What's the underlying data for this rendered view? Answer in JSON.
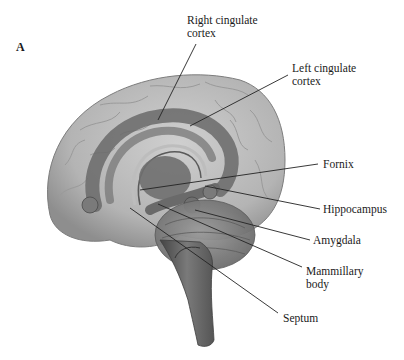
{
  "figure": {
    "panel_letter": "A",
    "labels": [
      {
        "id": "right-cingulate-cortex",
        "text": "Right cingulate\ncortex",
        "x": 187,
        "y": 14
      },
      {
        "id": "left-cingulate-cortex",
        "text": "Left cingulate\ncortex",
        "x": 292,
        "y": 62
      },
      {
        "id": "fornix",
        "text": "Fornix",
        "x": 323,
        "y": 158
      },
      {
        "id": "hippocampus",
        "text": "Hippocampus",
        "x": 323,
        "y": 203
      },
      {
        "id": "amygdala",
        "text": "Amygdala",
        "x": 313,
        "y": 234
      },
      {
        "id": "mammillary-body",
        "text": "Mammillary\nbody",
        "x": 306,
        "y": 265
      },
      {
        "id": "septum",
        "text": "Septum",
        "x": 283,
        "y": 312
      }
    ],
    "leader_lines": [
      {
        "id": "right-cingulate-cortex",
        "x1": 196,
        "y1": 44,
        "x2": 158,
        "y2": 120
      },
      {
        "id": "left-cingulate-cortex",
        "x1": 288,
        "y1": 75,
        "x2": 190,
        "y2": 126
      },
      {
        "id": "fornix",
        "x1": 318,
        "y1": 164,
        "x2": 140,
        "y2": 190
      },
      {
        "id": "hippocampus",
        "x1": 320,
        "y1": 209,
        "x2": 205,
        "y2": 186
      },
      {
        "id": "amygdala",
        "x1": 310,
        "y1": 240,
        "x2": 195,
        "y2": 210
      },
      {
        "id": "mammillary-body",
        "x1": 302,
        "y1": 267,
        "x2": 158,
        "y2": 204
      },
      {
        "id": "septum",
        "x1": 278,
        "y1": 313,
        "x2": 130,
        "y2": 208
      }
    ],
    "colors": {
      "background": "#ffffff",
      "cortex": "#b8b8b8",
      "cortex_shadow": "#8f8f8f",
      "limbic": "#6e6e6e",
      "cerebellum": "#8a8a8a",
      "brainstem": "#5e5e5e",
      "text": "#1a1a1a",
      "line": "#222222"
    }
  }
}
